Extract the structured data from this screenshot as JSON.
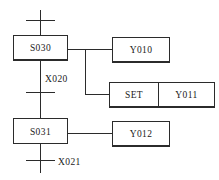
{
  "diagram": {
    "type": "sfc-ladder",
    "title": "",
    "line_color": "#2b2b2b",
    "background_color": "#ffffff",
    "steps": [
      {
        "id": "s030",
        "label": "S030"
      },
      {
        "id": "s031",
        "label": "S031"
      }
    ],
    "transitions": [
      {
        "id": "t-top",
        "label": ""
      },
      {
        "id": "t-x020",
        "label": "X020"
      },
      {
        "id": "t-x021",
        "label": "X021"
      }
    ],
    "actions": [
      {
        "id": "y010",
        "label": "Y010",
        "from_step": "S030"
      },
      {
        "id": "set",
        "label": "SET",
        "from_step": "S030"
      },
      {
        "id": "y011",
        "label": "Y011",
        "from_step": "S030"
      },
      {
        "id": "y012",
        "label": "Y012",
        "from_step": "S031"
      }
    ]
  }
}
